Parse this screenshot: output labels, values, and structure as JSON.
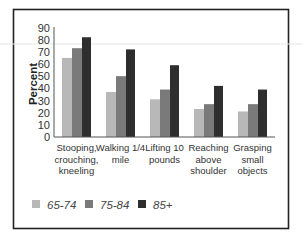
{
  "chart_data": {
    "type": "bar",
    "title": "",
    "xlabel": "",
    "ylabel": "Percent",
    "ylim": [
      0,
      90
    ],
    "yticks": [
      0,
      10,
      20,
      30,
      40,
      50,
      60,
      70,
      80,
      90
    ],
    "grid": false,
    "legend_position": "bottom-left",
    "categories": [
      [
        "Stooping,",
        "crouching,",
        "kneeling"
      ],
      [
        "Walking 1/4",
        "mile"
      ],
      [
        "Lifting 10",
        "pounds"
      ],
      [
        "Reaching",
        "above",
        "shoulder"
      ],
      [
        "Grasping",
        "small",
        "objects"
      ]
    ],
    "series": [
      {
        "name": "65-74",
        "color": "#b8b8b8",
        "values": [
          65,
          37,
          31,
          23,
          21
        ]
      },
      {
        "name": "75-84",
        "color": "#7a7a7a",
        "values": [
          73,
          50,
          39,
          27,
          27
        ]
      },
      {
        "name": "85+",
        "color": "#2e2e2e",
        "values": [
          82,
          72,
          59,
          42,
          39
        ]
      }
    ]
  }
}
